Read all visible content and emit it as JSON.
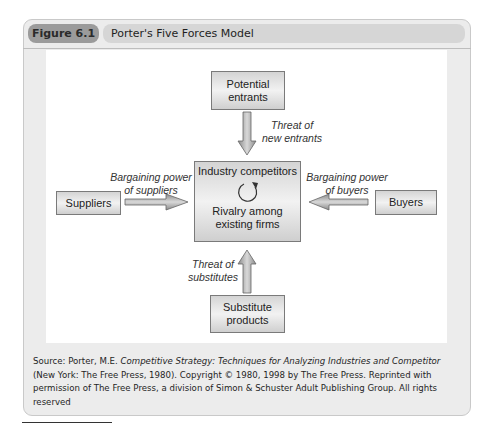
{
  "figure": {
    "number": "Figure 6.1",
    "title": "Porter's Five Forces Model"
  },
  "diagram": {
    "center": {
      "title": "Industry competitors",
      "icon": "cycle-arrow-icon",
      "subtitle_line1": "Rivalry among",
      "subtitle_line2": "existing firms"
    },
    "top": {
      "line1": "Potential",
      "line2": "entrants",
      "arrow_label_line1": "Threat of",
      "arrow_label_line2": "new entrants"
    },
    "left": {
      "label": "Suppliers",
      "arrow_label_line1": "Bargaining power",
      "arrow_label_line2": "of suppliers"
    },
    "right": {
      "label": "Buyers",
      "arrow_label_line1": "Bargaining power",
      "arrow_label_line2": "of buyers"
    },
    "bottom": {
      "line1": "Substitute",
      "line2": "products",
      "arrow_label_line1": "Threat of",
      "arrow_label_line2": "substitutes"
    }
  },
  "caption": {
    "prefix": "Source: Porter, M.E. ",
    "book_title": "Competitive Strategy: Techniques for Analyzing Industries and Competitor",
    "suffix": " (New York: The Free Press, 1980). Copyright © 1980, 1998 by The Free Press. Reprinted with permission of The Free Press, a division of Simon & Schuster Adult Publishing Group. All rights reserved"
  }
}
